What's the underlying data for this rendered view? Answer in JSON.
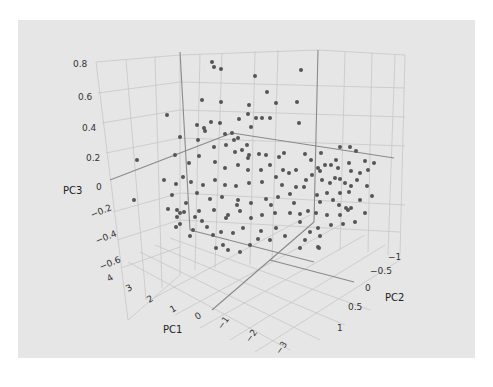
{
  "chart_data": {
    "type": "scatter",
    "title": "",
    "dimensions": 3,
    "axes": {
      "x": {
        "label": "PC1",
        "ticks": [
          "4",
          "3",
          "2",
          "1",
          "0",
          "−1",
          "−2",
          "−3"
        ]
      },
      "y": {
        "label": "PC2",
        "ticks": [
          "−1",
          "−0.5",
          "0",
          "0.5",
          "1"
        ]
      },
      "z": {
        "label": "PC3",
        "ticks": [
          "0.8",
          "0.6",
          "0.4",
          "0.2",
          "0",
          "−0.2",
          "−0.4",
          "−0.6"
        ]
      }
    },
    "grid": true,
    "legend": null,
    "marker_color": "#555555",
    "background": "#e6e6e6",
    "n_points_approx": 200,
    "series": [
      {
        "name": "samples",
        "screen_points": [
          [
            212,
            62
          ],
          [
            214,
            67
          ],
          [
            221,
            69
          ],
          [
            255,
            76
          ],
          [
            301,
            70
          ],
          [
            267,
            92
          ],
          [
            202,
            100
          ],
          [
            221,
            102
          ],
          [
            276,
            103
          ],
          [
            249,
            105
          ],
          [
            297,
            102
          ],
          [
            248,
            114
          ],
          [
            256,
            118
          ],
          [
            239,
            119
          ],
          [
            262,
            118
          ],
          [
            270,
            118
          ],
          [
            211,
            122
          ],
          [
            220,
            123
          ],
          [
            197,
            125
          ],
          [
            204,
            128
          ],
          [
            251,
            127
          ],
          [
            299,
            123
          ],
          [
            205,
            131
          ],
          [
            225,
            134
          ],
          [
            232,
            133
          ],
          [
            238,
            138
          ],
          [
            234,
            140
          ],
          [
            180,
            137
          ],
          [
            198,
            140
          ],
          [
            226,
            145
          ],
          [
            167,
            115
          ],
          [
            137,
            160
          ],
          [
            214,
            147
          ],
          [
            235,
            152
          ],
          [
            242,
            150
          ],
          [
            249,
            155
          ],
          [
            259,
            154
          ],
          [
            266,
            155
          ],
          [
            279,
            157
          ],
          [
            284,
            153
          ],
          [
            305,
            154
          ],
          [
            311,
            160
          ],
          [
            321,
            153
          ],
          [
            340,
            147
          ],
          [
            350,
            147
          ],
          [
            356,
            151
          ],
          [
            336,
            160
          ],
          [
            331,
            165
          ],
          [
            349,
            163
          ],
          [
            365,
            161
          ],
          [
            374,
            163
          ],
          [
            318,
            168
          ],
          [
            325,
            165
          ],
          [
            320,
            171
          ],
          [
            338,
            168
          ],
          [
            351,
            171
          ],
          [
            360,
            173
          ],
          [
            368,
            170
          ],
          [
            312,
            175
          ],
          [
            322,
            180
          ],
          [
            330,
            183
          ],
          [
            335,
            178
          ],
          [
            340,
            179
          ],
          [
            345,
            183
          ],
          [
            351,
            186
          ],
          [
            357,
            180
          ],
          [
            367,
            186
          ],
          [
            304,
            187
          ],
          [
            317,
            195
          ],
          [
            327,
            193
          ],
          [
            340,
            193
          ],
          [
            349,
            192
          ],
          [
            320,
            202
          ],
          [
            333,
            200
          ],
          [
            339,
            205
          ],
          [
            346,
            208
          ],
          [
            316,
            213
          ],
          [
            327,
            215
          ],
          [
            340,
            215
          ],
          [
            351,
            208
          ],
          [
            365,
            213
          ],
          [
            318,
            228
          ],
          [
            331,
            225
          ],
          [
            343,
            224
          ],
          [
            355,
            222
          ],
          [
            310,
            232
          ],
          [
            320,
            236
          ],
          [
            348,
            210
          ],
          [
            360,
            200
          ],
          [
            372,
            196
          ],
          [
            175,
            155
          ],
          [
            189,
            163
          ],
          [
            199,
            156
          ],
          [
            215,
            162
          ],
          [
            225,
            168
          ],
          [
            238,
            165
          ],
          [
            248,
            170
          ],
          [
            261,
            170
          ],
          [
            270,
            165
          ],
          [
            283,
            170
          ],
          [
            289,
            173
          ],
          [
            296,
            170
          ],
          [
            276,
            177
          ],
          [
            262,
            182
          ],
          [
            249,
            183
          ],
          [
            236,
            186
          ],
          [
            225,
            185
          ],
          [
            215,
            180
          ],
          [
            203,
            185
          ],
          [
            191,
            182
          ],
          [
            183,
            177
          ],
          [
            176,
            184
          ],
          [
            197,
            193
          ],
          [
            210,
            199
          ],
          [
            222,
            197
          ],
          [
            238,
            200
          ],
          [
            251,
            203
          ],
          [
            266,
            199
          ],
          [
            278,
            197
          ],
          [
            290,
            194
          ],
          [
            296,
            187
          ],
          [
            306,
            180
          ],
          [
            186,
            203
          ],
          [
            177,
            210
          ],
          [
            184,
            212
          ],
          [
            199,
            211
          ],
          [
            214,
            210
          ],
          [
            228,
            215
          ],
          [
            240,
            211
          ],
          [
            251,
            218
          ],
          [
            262,
            215
          ],
          [
            275,
            213
          ],
          [
            290,
            213
          ],
          [
            300,
            214
          ],
          [
            300,
            222
          ],
          [
            276,
            228
          ],
          [
            261,
            231
          ],
          [
            243,
            228
          ],
          [
            233,
            233
          ],
          [
            221,
            232
          ],
          [
            207,
            227
          ],
          [
            193,
            230
          ],
          [
            180,
            224
          ],
          [
            223,
            245
          ],
          [
            258,
            239
          ],
          [
            285,
            236
          ],
          [
            305,
            240
          ],
          [
            190,
            236
          ],
          [
            202,
            221
          ],
          [
            213,
            235
          ],
          [
            177,
            217
          ],
          [
            195,
            217
          ],
          [
            168,
            209
          ],
          [
            176,
            227
          ],
          [
            164,
            180
          ],
          [
            172,
            195
          ],
          [
            134,
            200
          ],
          [
            180,
            213
          ],
          [
            247,
            145
          ],
          [
            248,
            158
          ],
          [
            226,
            218
          ],
          [
            237,
            205
          ],
          [
            271,
            205
          ],
          [
            282,
            185
          ],
          [
            294,
            203
          ],
          [
            308,
            211
          ],
          [
            319,
            248
          ],
          [
            318,
            247
          ],
          [
            300,
            248
          ],
          [
            270,
            240
          ],
          [
            250,
            245
          ],
          [
            240,
            252
          ],
          [
            228,
            250
          ],
          [
            216,
            248
          ]
        ]
      }
    ],
    "bleed_text_note": "faint scanned text above and below the figure panel"
  }
}
